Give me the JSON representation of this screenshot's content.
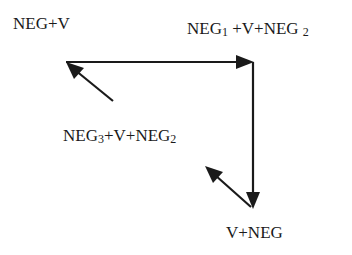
{
  "diagram": {
    "nodes": {
      "top_left": {
        "text": "NEG+V"
      },
      "top_right": {
        "parts": [
          "NEG",
          "1",
          " +V+NEG ",
          "2"
        ]
      },
      "middle": {
        "parts": [
          "NEG",
          "3",
          "+V+NEG",
          "2"
        ]
      },
      "bottom_right": {
        "text": "V+NEG"
      }
    },
    "edges": [
      {
        "from": "NEG1+V+NEG2 (left of)",
        "to": "NEG+V",
        "note": "horizontal arrow from corner pointing right"
      },
      {
        "from": "corner",
        "to": "V+NEG",
        "note": "vertical arrow pointing down"
      },
      {
        "from": "NEG3+V+NEG2",
        "to": "NEG+V",
        "note": "diagonal arrow pointing up-left"
      },
      {
        "from": "V+NEG",
        "to": "NEG3+V+NEG2",
        "note": "diagonal arrow pointing up-left"
      }
    ],
    "colors": {
      "ink": "#1a1a1a",
      "background": "#ffffff"
    }
  }
}
